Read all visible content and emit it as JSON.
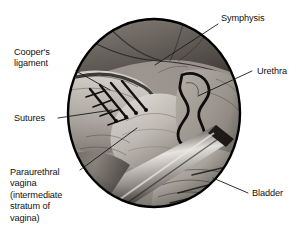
{
  "figure": {
    "type": "medical-illustration",
    "view": "circular-operative-field",
    "background_color": "#ffffff",
    "outline_color": "#000000",
    "palette": {
      "tissue_light": "#cfcbc6",
      "tissue_mid": "#9a948d",
      "tissue_dark": "#55504b",
      "shadow": "#2b2826",
      "highlight": "#ece9e4",
      "instrument_light": "#e7e4df",
      "instrument_dark": "#3a3734",
      "leader_line": "#1a1a1a"
    }
  },
  "circle": {
    "center_x": 154,
    "center_y": 113,
    "radius_x": 88,
    "radius_y": 96,
    "border_width": 2
  },
  "labels": [
    {
      "id": "coopers-ligament",
      "name": "Cooper's ligament",
      "lines": [
        "Cooper's",
        "ligament"
      ],
      "side": "left",
      "text_x": 14,
      "text_y": 47,
      "leader": {
        "x1": 76,
        "y1": 71,
        "x2": 110,
        "y2": 90
      }
    },
    {
      "id": "sutures",
      "name": "Sutures",
      "lines": [
        "Sutures"
      ],
      "side": "left",
      "text_x": 14,
      "text_y": 113,
      "leader": {
        "x1": 58,
        "y1": 118,
        "x2": 112,
        "y2": 110
      }
    },
    {
      "id": "paraurethral-vagina",
      "name": "Paraurethral vagina (intermediate stratum of vagina)",
      "lines": [
        "Paraurethral",
        "vagina",
        "(intermediate",
        "stratum of",
        "vagina)"
      ],
      "side": "left",
      "text_x": 10,
      "text_y": 167,
      "leader": {
        "x1": 80,
        "y1": 170,
        "x2": 137,
        "y2": 128
      }
    },
    {
      "id": "symphysis",
      "name": "Symphysis",
      "lines": [
        "Symphysis"
      ],
      "side": "right",
      "text_x": 221,
      "text_y": 13,
      "leader": {
        "x1": 218,
        "y1": 24,
        "x2": 155,
        "y2": 65
      }
    },
    {
      "id": "urethra",
      "name": "Urethra",
      "lines": [
        "Urethra"
      ],
      "side": "right",
      "text_x": 257,
      "text_y": 66,
      "leader": {
        "x1": 252,
        "y1": 71,
        "x2": 198,
        "y2": 96
      }
    },
    {
      "id": "bladder",
      "name": "Bladder",
      "lines": [
        "Bladder"
      ],
      "side": "right",
      "text_x": 252,
      "text_y": 188,
      "leader": {
        "x1": 248,
        "y1": 193,
        "x2": 213,
        "y2": 178
      }
    }
  ],
  "anatomy_features": [
    {
      "id": "symphysis-pubis",
      "label": "Symphysis",
      "region": "upper-center"
    },
    {
      "id": "coopers-ligament-band",
      "label": "Cooper's ligament",
      "region": "upper-left"
    },
    {
      "id": "suture-stitches",
      "label": "Sutures",
      "region": "mid-left",
      "count": 4
    },
    {
      "id": "urethra-tube",
      "label": "Urethra",
      "region": "right-center"
    },
    {
      "id": "bladder-wall",
      "label": "Bladder",
      "region": "lower-right"
    },
    {
      "id": "paraurethral-vagina-tissue",
      "label": "Paraurethral vagina",
      "region": "center"
    },
    {
      "id": "surgical-retractor",
      "label": "Surgical instrument",
      "region": "lower-center"
    }
  ]
}
